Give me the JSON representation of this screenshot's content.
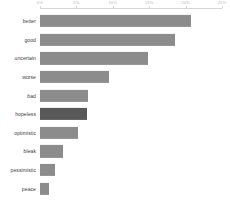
{
  "chart_data": {
    "type": "bar",
    "orientation": "horizontal",
    "title": "",
    "subtitle": "",
    "xlabel": "",
    "ylabel": "",
    "xlim": [
      0,
      25
    ],
    "ylim": null,
    "grid": false,
    "legend": null,
    "legend_position": "none",
    "axis_position": "top",
    "value_suffix": "%",
    "categories": [
      "better",
      "good",
      "uncertain",
      "worse",
      "bad",
      "hopeless",
      "optimistic",
      "bleak",
      "pessimistic",
      "peace"
    ],
    "values": [
      20.7,
      18.5,
      14.8,
      9.5,
      6.6,
      6.4,
      5.2,
      3.1,
      2.0,
      1.3
    ],
    "highlighted_categories": [
      "hopeless"
    ],
    "tick_labels": [
      "0%",
      "5%",
      "10%",
      "15%",
      "20%",
      "25%"
    ],
    "tick_values": [
      0,
      5,
      10,
      15,
      20,
      25
    ],
    "colors": {
      "bar": "#8c8c8c",
      "bar_highlight": "#585858",
      "axis": "#d5d5d5",
      "tick_label": "#b9b9b9",
      "category_label": "#3d3d3d",
      "background": "#ffffff"
    }
  }
}
